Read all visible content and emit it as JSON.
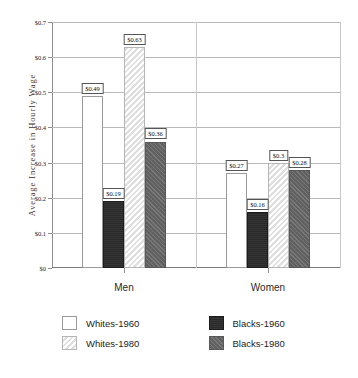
{
  "chart_data": {
    "type": "bar",
    "title": "",
    "xlabel": "",
    "ylabel": "Average Increase in Hourly Wage",
    "ylim": [
      0,
      0.7
    ],
    "grid": true,
    "legend_position": "bottom",
    "categories": [
      "Men",
      "Women"
    ],
    "ytick_labels": [
      "$0.7",
      "$0.6",
      "$0.5",
      "$0.4",
      "$0.3",
      "$0.2",
      "$0.1",
      "$0"
    ],
    "ytick_values": [
      0.7,
      0.6,
      0.5,
      0.4,
      0.3,
      0.2,
      0.1,
      0
    ],
    "series": [
      {
        "name": "Whites-1960",
        "color": "#ffffff",
        "pattern": "solid-white",
        "values": [
          0.49,
          0.27
        ],
        "labels": [
          "$0.49",
          "$0.27"
        ]
      },
      {
        "name": "Blacks-1960",
        "color": "#2b2b2b",
        "pattern": "solid-dark",
        "values": [
          0.19,
          0.16
        ],
        "labels": [
          "$0.19",
          "$0.16"
        ]
      },
      {
        "name": "Whites-1980",
        "color": "#f2f2f2",
        "pattern": "diagonal-hatch-light",
        "values": [
          0.63,
          0.3
        ],
        "labels": [
          "$0.63",
          "$0.3"
        ]
      },
      {
        "name": "Blacks-1980",
        "color": "#6b6b6b",
        "pattern": "textured-gray",
        "values": [
          0.36,
          0.28
        ],
        "labels": [
          "$0.36",
          "$0.28"
        ]
      }
    ]
  },
  "legend": {
    "items": [
      {
        "label": "Whites-1960",
        "swatch": "whites-1960"
      },
      {
        "label": "Blacks-1960",
        "swatch": "blacks-1960"
      },
      {
        "label": "Whites-1980",
        "swatch": "whites-1980"
      },
      {
        "label": "Blacks-1980",
        "swatch": "blacks-1980"
      }
    ]
  }
}
